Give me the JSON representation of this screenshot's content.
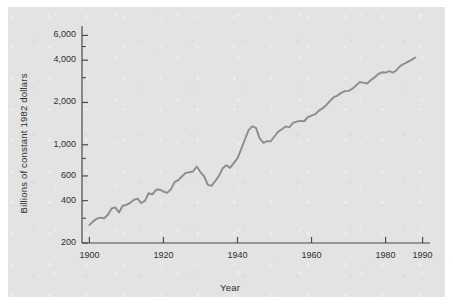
{
  "figure": {
    "background_color": "#ffffff",
    "panel_color": "#e3e3e3",
    "line_color": "#8c8c8c",
    "axis_color": "#4a4a4a",
    "text_color": "#2e2e2e"
  },
  "chart_data": {
    "type": "line",
    "title": "",
    "subtitle": "",
    "xlabel": "Year",
    "ylabel": "Billions of constant 1982 dollars",
    "yscale": "log",
    "xscale": "linear",
    "grid": false,
    "legend": null,
    "xlim": [
      1898,
      1992
    ],
    "ylim": [
      200,
      7000
    ],
    "xticks": [
      1900,
      1920,
      1940,
      1960,
      1980,
      1990
    ],
    "xtick_labels": [
      "1900",
      "1920",
      "1940",
      "1960",
      "1980",
      "1990"
    ],
    "yticks": [
      200,
      400,
      600,
      1000,
      2000,
      4000,
      6000
    ],
    "ytick_labels": [
      "200",
      "400",
      "600",
      "1,000",
      "2,000",
      "4,000",
      "6,000"
    ],
    "yminor_ticks": [
      300,
      800,
      3000,
      5000
    ],
    "series": [
      {
        "name": "Real GNP",
        "x": [
          1900,
          1901,
          1902,
          1903,
          1904,
          1905,
          1906,
          1907,
          1908,
          1909,
          1910,
          1911,
          1912,
          1913,
          1914,
          1915,
          1916,
          1917,
          1918,
          1919,
          1920,
          1921,
          1922,
          1923,
          1924,
          1925,
          1926,
          1927,
          1928,
          1929,
          1930,
          1931,
          1932,
          1933,
          1934,
          1935,
          1936,
          1937,
          1938,
          1939,
          1940,
          1941,
          1942,
          1943,
          1944,
          1945,
          1946,
          1947,
          1948,
          1949,
          1950,
          1951,
          1952,
          1953,
          1954,
          1955,
          1956,
          1957,
          1958,
          1959,
          1960,
          1961,
          1962,
          1963,
          1964,
          1965,
          1966,
          1967,
          1968,
          1969,
          1970,
          1971,
          1972,
          1973,
          1974,
          1975,
          1976,
          1977,
          1978,
          1979,
          1980,
          1981,
          1982,
          1983,
          1984,
          1985,
          1986,
          1987,
          1988
        ],
        "values": [
          268,
          285,
          298,
          303,
          300,
          318,
          352,
          358,
          330,
          368,
          374,
          386,
          405,
          414,
          385,
          399,
          452,
          443,
          478,
          480,
          465,
          455,
          481,
          542,
          560,
          595,
          631,
          637,
          645,
          700,
          638,
          596,
          518,
          510,
          552,
          602,
          680,
          715,
          685,
          740,
          800,
          930,
          1090,
          1270,
          1350,
          1320,
          1110,
          1030,
          1060,
          1060,
          1150,
          1240,
          1290,
          1350,
          1330,
          1430,
          1460,
          1480,
          1470,
          1570,
          1610,
          1650,
          1750,
          1820,
          1920,
          2050,
          2180,
          2240,
          2340,
          2410,
          2420,
          2500,
          2640,
          2790,
          2770,
          2730,
          2880,
          3010,
          3180,
          3280,
          3260,
          3340,
          3260,
          3410,
          3640,
          3770,
          3890,
          4020,
          4180
        ]
      }
    ]
  },
  "annotations": []
}
